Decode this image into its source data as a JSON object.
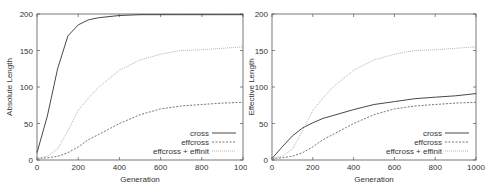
{
  "chart_data": [
    {
      "type": "line",
      "title": "",
      "xlabel": "Generation",
      "ylabel": "Absolute Length",
      "xlim": [
        0,
        1000
      ],
      "ylim": [
        0,
        200
      ],
      "xticks": [
        0,
        200,
        400,
        600,
        800,
        1000
      ],
      "yticks": [
        0,
        50,
        100,
        150,
        200
      ],
      "legend_position": "lower right",
      "x": [
        0,
        50,
        100,
        150,
        200,
        250,
        300,
        400,
        500,
        600,
        700,
        800,
        900,
        1000
      ],
      "series": [
        {
          "name": "cross",
          "style": "solid",
          "color": "#333333",
          "values": [
            10,
            60,
            125,
            170,
            185,
            192,
            195,
            198,
            199,
            199,
            199,
            199,
            199,
            199
          ]
        },
        {
          "name": "effcross",
          "style": "dashed",
          "color": "#666666",
          "values": [
            2,
            3,
            5,
            10,
            18,
            28,
            35,
            50,
            62,
            70,
            74,
            76,
            78,
            79
          ]
        },
        {
          "name": "effcross + effinit",
          "style": "dotted",
          "color": "#aaaaaa",
          "values": [
            2,
            5,
            15,
            40,
            68,
            85,
            100,
            123,
            137,
            145,
            150,
            151,
            153,
            155
          ]
        }
      ]
    },
    {
      "type": "line",
      "title": "",
      "xlabel": "Generation",
      "ylabel": "Effective Length",
      "xlim": [
        0,
        1000
      ],
      "ylim": [
        0,
        200
      ],
      "xticks": [
        0,
        200,
        400,
        600,
        800,
        1000
      ],
      "yticks": [
        0,
        50,
        100,
        150,
        200
      ],
      "legend_position": "lower right",
      "x": [
        0,
        50,
        100,
        150,
        200,
        250,
        300,
        400,
        500,
        600,
        700,
        800,
        900,
        1000
      ],
      "series": [
        {
          "name": "cross",
          "style": "solid",
          "color": "#333333",
          "values": [
            2,
            18,
            33,
            44,
            51,
            57,
            61,
            69,
            76,
            80,
            84,
            86,
            88,
            91
          ]
        },
        {
          "name": "effcross",
          "style": "dashed",
          "color": "#666666",
          "values": [
            2,
            3,
            5,
            10,
            18,
            28,
            35,
            50,
            62,
            70,
            74,
            76,
            78,
            79
          ]
        },
        {
          "name": "effcross + effinit",
          "style": "dotted",
          "color": "#aaaaaa",
          "values": [
            2,
            5,
            15,
            40,
            68,
            85,
            100,
            123,
            137,
            145,
            150,
            151,
            153,
            155
          ]
        }
      ]
    }
  ]
}
